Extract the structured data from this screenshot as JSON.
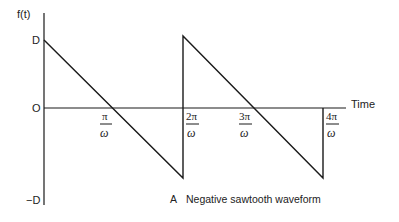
{
  "diagram": {
    "y_axis_label": "f(t)",
    "x_axis_label": "Time",
    "y_ticks": {
      "top": "D",
      "zero": "O",
      "bottom": "−D"
    },
    "x_ticks": [
      {
        "numerator": "π",
        "denominator": "ω"
      },
      {
        "numerator": "2π",
        "denominator": "ω"
      },
      {
        "numerator": "3π",
        "denominator": "ω"
      },
      {
        "numerator": "4π",
        "denominator": "ω"
      }
    ],
    "caption_letter": "A",
    "caption_text": "Negative sawtooth waveform",
    "line_color": "#1a1a1a"
  }
}
